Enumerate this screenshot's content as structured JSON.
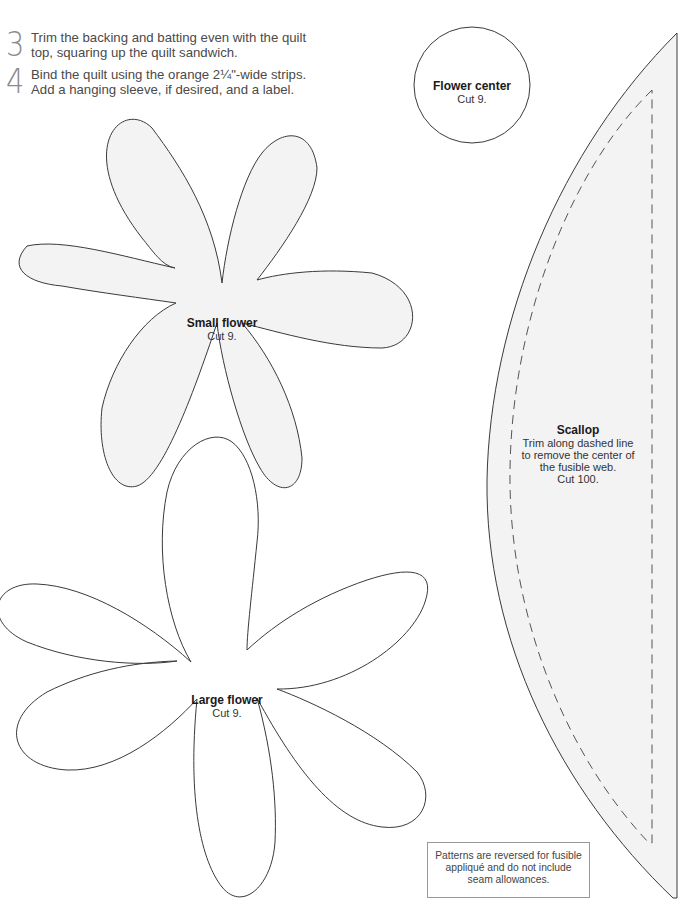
{
  "steps": [
    {
      "number": "3",
      "text_line1": "Trim the backing and batting even with the quilt",
      "text_line2": "top, squaring up the quilt sandwich."
    },
    {
      "number": "4",
      "text_line1": "Bind the quilt using the orange 2¼\"-wide strips.",
      "text_line2": "Add a hanging sleeve, if desired, and a label."
    }
  ],
  "patterns": {
    "flower_center": {
      "title": "Flower center",
      "cut": "Cut 9."
    },
    "small_flower": {
      "title": "Small flower",
      "cut": "Cut 9."
    },
    "large_flower": {
      "title": "Large flower",
      "cut": "Cut 9."
    },
    "scallop": {
      "title": "Scallop",
      "line1": "Trim along dashed line",
      "line2": "to remove the center of",
      "line3": "the fusible web.",
      "cut": "Cut 100."
    }
  },
  "note": {
    "line1": "Patterns are reversed for fusible",
    "line2": "appliqué and do not include",
    "line3": "seam allowances."
  },
  "colors": {
    "outline": "#3a3a3a",
    "shape_fill": "#f3f3f3",
    "step_number": "#8a8a8a"
  }
}
